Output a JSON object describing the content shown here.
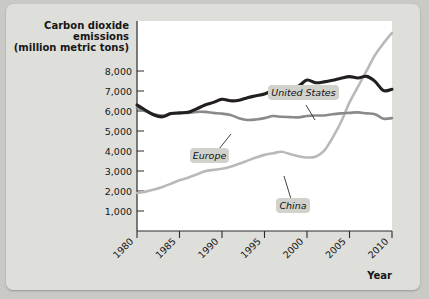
{
  "chart_data": {
    "type": "line",
    "title": "Carbon dioxide emissions (million metric tons)",
    "title_lines": [
      "Carbon dioxide",
      "emissions",
      "(million metric tons)"
    ],
    "xlabel": "Year",
    "ylabel": "Carbon dioxide emissions (million metric tons)",
    "xlim": [
      1980,
      2010
    ],
    "ylim": [
      0,
      8000
    ],
    "grid": false,
    "legend_position": "inline-annotations",
    "y_ticks": [
      1000,
      2000,
      3000,
      4000,
      5000,
      6000,
      7000,
      8000
    ],
    "y_tick_labels": [
      "1,000",
      "2,000",
      "3,000",
      "4,000",
      "5,000",
      "6,000",
      "7,000",
      "8,000"
    ],
    "x_ticks": [
      1980,
      1985,
      1990,
      1995,
      2000,
      2005,
      2010
    ],
    "x_tick_labels": [
      "1980",
      "1985",
      "1990",
      "1995",
      "2000",
      "2005",
      "2010"
    ],
    "x": [
      1980,
      1981,
      1982,
      1983,
      1984,
      1985,
      1986,
      1987,
      1988,
      1989,
      1990,
      1991,
      1992,
      1993,
      1994,
      1995,
      1996,
      1997,
      1998,
      1999,
      2000,
      2001,
      2002,
      2003,
      2004,
      2005,
      2006,
      2007,
      2008,
      2009,
      2010
    ],
    "series": [
      {
        "name": "United States",
        "color": "#231f20",
        "values": [
          4800,
          4600,
          4420,
          4350,
          4480,
          4500,
          4520,
          4650,
          4800,
          4900,
          5020,
          4960,
          4980,
          5080,
          5150,
          5220,
          5350,
          5420,
          5450,
          5520,
          5750,
          5650,
          5680,
          5740,
          5820,
          5880,
          5830,
          5890,
          5700,
          5350,
          5400
        ]
      },
      {
        "name": "Europe",
        "color": "#8a8a8a",
        "values": [
          4700,
          4560,
          4450,
          4400,
          4470,
          4490,
          4500,
          4540,
          4540,
          4500,
          4470,
          4420,
          4300,
          4230,
          4250,
          4300,
          4380,
          4350,
          4340,
          4330,
          4380,
          4400,
          4400,
          4450,
          4480,
          4500,
          4520,
          4480,
          4450,
          4280,
          4300
        ]
      },
      {
        "name": "China",
        "color": "#b9b9b9",
        "values": [
          1450,
          1500,
          1580,
          1680,
          1800,
          1930,
          2030,
          2150,
          2280,
          2330,
          2370,
          2450,
          2560,
          2680,
          2800,
          2900,
          2960,
          3020,
          2930,
          2850,
          2800,
          2830,
          3050,
          3550,
          4150,
          4900,
          5500,
          6100,
          6700,
          7150,
          7550
        ]
      }
    ],
    "annotations": [
      {
        "label": "United States",
        "series": "United States"
      },
      {
        "label": "Europe",
        "series": "Europe"
      },
      {
        "label": "China",
        "series": "China"
      }
    ]
  }
}
